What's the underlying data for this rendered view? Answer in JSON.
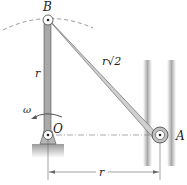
{
  "diagram": {
    "type": "mechanism",
    "points": {
      "B": {
        "label": "B"
      },
      "O": {
        "label": "O"
      },
      "A": {
        "label": "A"
      }
    },
    "links": [
      {
        "from": "O",
        "to": "B",
        "label": "r"
      },
      {
        "from": "B",
        "to": "A",
        "label": "r√2"
      }
    ],
    "dimensions": [
      {
        "from": "O",
        "to": "A",
        "label": "r",
        "orientation": "horizontal"
      }
    ],
    "angular_velocity": {
      "label": "ω",
      "at": "O"
    },
    "colors": {
      "link_fill": "#c8c8c8",
      "crank_fill": "#a9a9a9",
      "outline": "#444444",
      "guide": "#b5b5b5",
      "dashed_arc": "#9a9a9a"
    }
  }
}
